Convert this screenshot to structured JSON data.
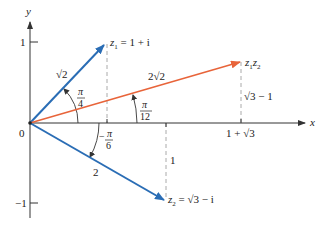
{
  "diagram": {
    "type": "complex-plane-vector-diagram",
    "axes": {
      "x_label": "x",
      "y_label": "y",
      "origin_label": "0",
      "y_ticks": [
        {
          "value": 1,
          "label": "1"
        },
        {
          "value": -1,
          "label": "−1"
        }
      ]
    },
    "vectors": [
      {
        "id": "z1",
        "label_main": "z",
        "label_sub": "1",
        "label_rest": " = 1 + i",
        "modulus_label": "√2",
        "angle_label_num": "π",
        "angle_label_den": "4",
        "color": "#2a6db5"
      },
      {
        "id": "z1z2",
        "label_a": "z",
        "label_a_sub": "1",
        "label_b": "z",
        "label_b_sub": "2",
        "modulus_label": "2√2",
        "angle_label_num": "π",
        "angle_label_den": "12",
        "x_proj_label": "1 + √3",
        "y_proj_label": "√3 − 1",
        "color": "#e8643a"
      },
      {
        "id": "z2",
        "label_main": "z",
        "label_sub": "2",
        "label_rest": " = √3 − i",
        "modulus_label": "2",
        "angle_label_sign": "−",
        "angle_label_num": "π",
        "angle_label_den": "6",
        "y_proj_label": "1",
        "color": "#2a6db5"
      }
    ],
    "colors": {
      "axis": "#333333",
      "dashed": "#aaaaaa",
      "blue_vector": "#2a6db5",
      "orange_vector": "#e8643a"
    }
  }
}
